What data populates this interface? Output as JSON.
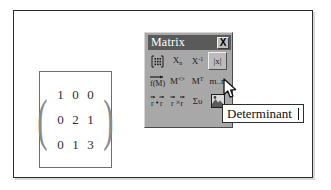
{
  "window": {
    "background_color": "#ffffff",
    "frame_color": "#2b2b2b"
  },
  "matrix_result": {
    "name": "matrix-result",
    "open_paren": "(",
    "close_paren": ")",
    "rows": [
      [
        "1",
        "0",
        "0"
      ],
      [
        "0",
        "2",
        "1"
      ],
      [
        "0",
        "1",
        "3"
      ]
    ]
  },
  "toolbar": {
    "title": "Matrix",
    "title_bar_color": "#5a5a5a",
    "face_color": "#a8a8a8",
    "close_label": "X",
    "buttons": [
      {
        "name": "insert-matrix-icon",
        "icon": "matrix-grid",
        "label": ""
      },
      {
        "name": "matrix-subscript-icon",
        "icon": "text",
        "label": "Xn"
      },
      {
        "name": "matrix-inverse-icon",
        "icon": "text",
        "label": "X-1"
      },
      {
        "name": "determinant-icon",
        "icon": "text",
        "label": "|x|",
        "hovered": true
      },
      {
        "name": "vectorize-arrow-icon",
        "icon": "text",
        "label": "f(M)"
      },
      {
        "name": "matrix-column-icon",
        "icon": "text",
        "label": "M<>"
      },
      {
        "name": "matrix-transpose-icon",
        "icon": "text",
        "label": "MT"
      },
      {
        "name": "matrix-range-icon",
        "icon": "text",
        "label": "m..n"
      },
      {
        "name": "dot-product-icon",
        "icon": "text",
        "label": "r·r"
      },
      {
        "name": "cross-product-icon",
        "icon": "text",
        "label": "r×r"
      },
      {
        "name": "vector-sum-icon",
        "icon": "text",
        "label": "Συ"
      },
      {
        "name": "picture-icon",
        "icon": "picture",
        "label": ""
      }
    ]
  },
  "tooltip": {
    "name": "tooltip-determinant",
    "text": "Determinant"
  },
  "cursor": {
    "name": "mouse-pointer",
    "kind": "arrow"
  }
}
